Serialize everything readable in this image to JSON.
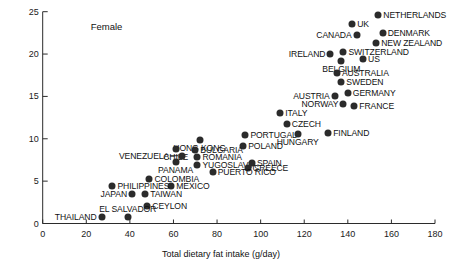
{
  "chart_data": {
    "type": "scatter",
    "title": "",
    "annotation": "Female",
    "xlabel": "Total dietary fat intake (g/day)",
    "ylabel": "Age-adjusted death rate(100,000 population)",
    "xlim": [
      0,
      180
    ],
    "ylim": [
      0,
      25
    ],
    "xticks": [
      0,
      20,
      40,
      60,
      80,
      100,
      120,
      140,
      160,
      180
    ],
    "yticks": [
      0,
      5,
      10,
      15,
      20,
      25
    ],
    "grid": false,
    "legend": "none",
    "points": [
      {
        "label": "NETHERLANDS",
        "x": 154,
        "y": 24.6,
        "pos": "right"
      },
      {
        "label": "UK",
        "x": 142,
        "y": 23.5,
        "pos": "right"
      },
      {
        "label": "CANADA",
        "x": 144,
        "y": 22.3,
        "pos": "left"
      },
      {
        "label": "DENMARK",
        "x": 156,
        "y": 22.5,
        "pos": "right"
      },
      {
        "label": "NEW ZEALAND",
        "x": 153,
        "y": 21.3,
        "pos": "right"
      },
      {
        "label": "SWITZERLAND",
        "x": 138,
        "y": 20.2,
        "pos": "right"
      },
      {
        "label": "IRELAND",
        "x": 132,
        "y": 20.0,
        "pos": "left"
      },
      {
        "label": "US",
        "x": 147,
        "y": 19.4,
        "pos": "right"
      },
      {
        "label": "BELGIUM",
        "x": 137,
        "y": 19.2,
        "pos": "center"
      },
      {
        "label": "AUSTRALIA",
        "x": 135,
        "y": 17.8,
        "pos": "right"
      },
      {
        "label": "SWEDEN",
        "x": 137,
        "y": 16.7,
        "pos": "right"
      },
      {
        "label": "GERMANY",
        "x": 140,
        "y": 15.4,
        "pos": "right"
      },
      {
        "label": "AUSTRIA",
        "x": 134,
        "y": 15.0,
        "pos": "left"
      },
      {
        "label": "NORWAY",
        "x": 138,
        "y": 14.1,
        "pos": "left"
      },
      {
        "label": "FRANCE",
        "x": 143,
        "y": 13.9,
        "pos": "right"
      },
      {
        "label": "ITALY",
        "x": 109,
        "y": 13.1,
        "pos": "right"
      },
      {
        "label": "CZECH",
        "x": 112,
        "y": 11.8,
        "pos": "right"
      },
      {
        "label": "PORTUGAL",
        "x": 93,
        "y": 10.4,
        "pos": "right"
      },
      {
        "label": "HUNGARY",
        "x": 117,
        "y": 10.6,
        "pos": "center"
      },
      {
        "label": "FINLAND",
        "x": 131,
        "y": 10.7,
        "pos": "right"
      },
      {
        "label": "POLAND",
        "x": 92,
        "y": 9.2,
        "pos": "right"
      },
      {
        "label": "HONG KONG",
        "x": 72,
        "y": 9.8,
        "pos": "center"
      },
      {
        "label": "CHILE",
        "x": 61,
        "y": 8.8,
        "pos": "center"
      },
      {
        "label": "BULGARIA",
        "x": 70,
        "y": 8.7,
        "pos": "right"
      },
      {
        "label": "VENEZUELA",
        "x": 64,
        "y": 8.0,
        "pos": "left-leader"
      },
      {
        "label": "ROMANIA",
        "x": 71,
        "y": 7.8,
        "pos": "right"
      },
      {
        "label": "PANAMA",
        "x": 61,
        "y": 7.3,
        "pos": "center"
      },
      {
        "label": "YUGOSLAVIA",
        "x": 71,
        "y": 6.9,
        "pos": "right"
      },
      {
        "label": "SPAIN",
        "x": 96,
        "y": 7.1,
        "pos": "right"
      },
      {
        "label": "GREECE",
        "x": 94,
        "y": 6.6,
        "pos": "right"
      },
      {
        "label": "PUERTO RICO",
        "x": 78,
        "y": 6.1,
        "pos": "right"
      },
      {
        "label": "COLOMBIA",
        "x": 49,
        "y": 5.2,
        "pos": "right"
      },
      {
        "label": "MEXICO",
        "x": 59,
        "y": 4.4,
        "pos": "right"
      },
      {
        "label": "PHILIPPINES",
        "x": 32,
        "y": 4.4,
        "pos": "right"
      },
      {
        "label": "JAPAN",
        "x": 41,
        "y": 3.5,
        "pos": "left"
      },
      {
        "label": "TAIWAN",
        "x": 47,
        "y": 3.5,
        "pos": "right"
      },
      {
        "label": "CEYLON",
        "x": 48,
        "y": 2.1,
        "pos": "right"
      },
      {
        "label": "EL SALVADOR",
        "x": 39,
        "y": 0.8,
        "pos": "center-above"
      },
      {
        "label": "THAILAND",
        "x": 27,
        "y": 0.8,
        "pos": "left"
      }
    ]
  }
}
